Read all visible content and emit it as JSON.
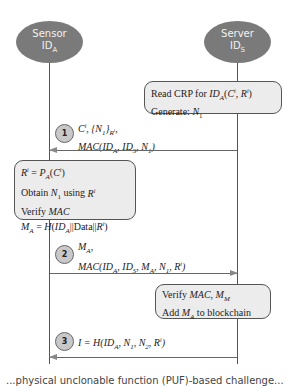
{
  "actors": {
    "sensor": {
      "name": "Sensor",
      "id": "ID",
      "id_sub": "A"
    },
    "server": {
      "name": "Server",
      "id": "ID",
      "id_sub": "S"
    }
  },
  "server_box_1": {
    "line1": "Read CRP for ID_A(C^i, R^i)",
    "line2": "Generate: N_1"
  },
  "message_1": {
    "step": "1",
    "line1": "C^i, {N_1}_{R^i},",
    "line2": "MAC(ID_A, ID_S, N_1)",
    "direction": "server-to-sensor"
  },
  "sensor_box": {
    "line1": "R^i = P_A(C^i)",
    "line2": "Obtain N_1 using R^i",
    "line3": "Verify MAC",
    "line4": "M_A = H(ID_A||Data||R^i)"
  },
  "message_2": {
    "step": "2",
    "line1": "M_A,",
    "line2": "MAC(ID_A, ID_S, M_A, N_1, R^i)",
    "direction": "sensor-to-server"
  },
  "server_box_2": {
    "line1": "Verify MAC, M_M",
    "line2": "Add M_A to blockchain"
  },
  "message_3": {
    "step": "3",
    "line1": "I = H(ID_A, N_1, N_2, R^i)",
    "direction": "server-to-sensor"
  },
  "caption": "...physical unclonable function (PUF)-based challenge..."
}
